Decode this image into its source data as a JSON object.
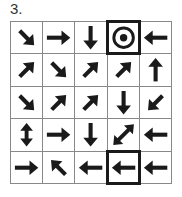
{
  "puzzle": {
    "number_label": "3.",
    "rows": 5,
    "cols": 5,
    "cells": [
      [
        "se",
        "e",
        "s",
        "target",
        "w"
      ],
      [
        "ne",
        "se",
        "ne",
        "ne",
        "n"
      ],
      [
        "se",
        "ne",
        "ne",
        "s",
        "sw"
      ],
      [
        "ns",
        "e",
        "s",
        "nesw",
        "w"
      ],
      [
        "e",
        "nw",
        "w",
        "w",
        "w"
      ]
    ],
    "highlighted_cells": [
      {
        "row": 0,
        "col": 3,
        "content": "target"
      },
      {
        "row": 4,
        "col": 3,
        "content": "w"
      }
    ]
  },
  "colors": {
    "arrow": "#1a1a1a",
    "grid_line": "#888888",
    "highlight_border": "#1a1a1a",
    "background": "#ffffff"
  },
  "icons": {
    "n": "arrow-up-icon",
    "s": "arrow-down-icon",
    "e": "arrow-right-icon",
    "w": "arrow-left-icon",
    "ne": "arrow-up-right-icon",
    "nw": "arrow-up-left-icon",
    "se": "arrow-down-right-icon",
    "sw": "arrow-down-left-icon",
    "ns": "arrow-up-down-icon",
    "nesw": "arrow-diagonal-double-icon",
    "target": "target-bullseye-icon"
  }
}
